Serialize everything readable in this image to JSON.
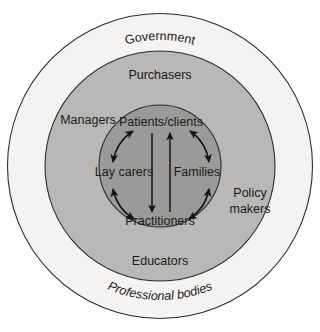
{
  "diagram": {
    "geometry": {
      "center_x": 160,
      "center_y": 166,
      "outer_radius": 152,
      "middle_radius": 115,
      "inner_radius": 61
    },
    "colors": {
      "page_background": "#fdfdfc",
      "outer_ring_fill": "#f4f3f1",
      "middle_ring_fill": "#b9b8b6",
      "inner_circle_fill": "#9b9a98",
      "stroke": "#2b2b2b",
      "text": "#1a1a1a",
      "arrow": "#141414"
    },
    "rings": [
      {
        "name": "outer-ring",
        "labels": [
          {
            "id": "government",
            "text": "Government",
            "position": "top-arc",
            "curved": true
          },
          {
            "id": "professional-bodies",
            "text": "Professional bodies",
            "position": "bottom-arc",
            "curved": true
          }
        ]
      },
      {
        "name": "middle-ring",
        "labels": [
          {
            "id": "purchasers",
            "text": "Purchasers",
            "position": "top",
            "curved": false
          },
          {
            "id": "managers",
            "text": "Managers",
            "position": "upper-left",
            "curved": false
          },
          {
            "id": "policy-makers",
            "text": "Policy\nmakers",
            "line1": "Policy",
            "line2": "makers",
            "position": "right",
            "curved": false
          },
          {
            "id": "educators",
            "text": "Educators",
            "position": "bottom",
            "curved": false
          }
        ]
      },
      {
        "name": "inner-circle",
        "labels": [
          {
            "id": "patients-clients",
            "text": "Patients/clients",
            "position": "top",
            "curved": false
          },
          {
            "id": "lay-carers",
            "text": "Lay carers",
            "position": "left",
            "curved": false
          },
          {
            "id": "families",
            "text": "Families",
            "position": "right",
            "curved": false
          },
          {
            "id": "practitioners",
            "text": "Practitioners",
            "position": "bottom",
            "curved": false
          }
        ]
      }
    ],
    "arrows": [
      {
        "id": "arrow-laycarers-patients",
        "kind": "curved",
        "heads": "double",
        "from": "Lay carers",
        "to": "Patients/clients"
      },
      {
        "id": "arrow-patients-families",
        "kind": "curved",
        "heads": "double",
        "from": "Patients/clients",
        "to": "Families"
      },
      {
        "id": "arrow-laycarers-practitioners",
        "kind": "curved",
        "heads": "double",
        "from": "Lay carers",
        "to": "Practitioners"
      },
      {
        "id": "arrow-families-practitioners",
        "kind": "curved",
        "heads": "double",
        "from": "Families",
        "to": "Practitioners"
      },
      {
        "id": "arrow-center-down",
        "kind": "straight",
        "heads": "single",
        "direction": "down",
        "from": "Patients/clients",
        "to": "Practitioners"
      },
      {
        "id": "arrow-center-up",
        "kind": "straight",
        "heads": "single",
        "direction": "up",
        "from": "Practitioners",
        "to": "Patients/clients"
      }
    ]
  }
}
